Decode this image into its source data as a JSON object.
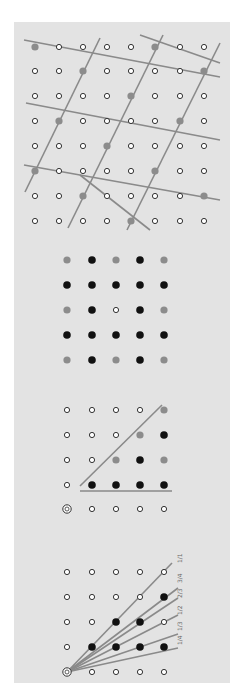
{
  "colors": {
    "background": "#ffffff",
    "panel": "#e3e3e3",
    "line": "#8a8a8a",
    "gray_dot": "#8c8c8c",
    "black_dot": "#111111",
    "white_dot_fill": "#ffffff",
    "white_dot_stroke": "#333333"
  },
  "panels": [
    {
      "id": "sublattice",
      "xs": [
        35,
        59,
        83,
        107,
        131,
        155,
        180,
        204
      ],
      "ys": [
        47,
        71,
        96,
        121,
        146,
        171,
        196,
        221
      ],
      "grid": [
        "GwwwwGww",
        "wwGwwwwG",
        "wwwwGwww",
        "wGwwwwGw",
        "wwwGwwww",
        "GwwwwGww",
        "wwGwwwwG",
        "wwwwGwww"
      ],
      "lines": [
        [
          24,
          40,
          220,
          77
        ],
        [
          140,
          35,
          220,
          63
        ],
        [
          26,
          103,
          220,
          140
        ],
        [
          24,
          165,
          220,
          200
        ],
        [
          80,
          175,
          150,
          230
        ],
        [
          100,
          38,
          25,
          192
        ],
        [
          163,
          35,
          68,
          228
        ],
        [
          220,
          43,
          127,
          230
        ]
      ]
    },
    {
      "id": "neighbors",
      "xs": [
        67,
        92,
        116,
        140,
        164
      ],
      "ys": [
        260,
        285,
        310,
        335,
        360
      ],
      "grid": [
        "GBGBG",
        "BBBBB",
        "GBwBG",
        "BBBBB",
        "GBGBG"
      ],
      "lines": []
    },
    {
      "id": "triangle",
      "xs": [
        67,
        92,
        116,
        140,
        164
      ],
      "ys": [
        410,
        435,
        460,
        485,
        509
      ],
      "grid": [
        "wwwwG",
        "wwwGB",
        "wwGBG",
        "wBBBB",
        "Owwww"
      ],
      "lines": [
        [
          80,
          486,
          162,
          405
        ],
        [
          80,
          491,
          172,
          491
        ]
      ]
    },
    {
      "id": "slopes",
      "xs": [
        67,
        92,
        116,
        140,
        164
      ],
      "ys": [
        572,
        597,
        622,
        647,
        672
      ],
      "grid": [
        "wwwww",
        "wwwwB",
        "wwBBw",
        "wBBBB",
        "Owwww"
      ],
      "lines": [
        [
          67,
          672,
          172,
          563
        ],
        [
          67,
          672,
          178,
          588
        ],
        [
          67,
          672,
          178,
          598
        ],
        [
          67,
          672,
          178,
          615
        ],
        [
          67,
          672,
          178,
          634
        ],
        [
          67,
          672,
          178,
          648
        ]
      ],
      "labels": [
        {
          "text": "1/1",
          "x": 182,
          "y": 563
        },
        {
          "text": "3/4",
          "x": 182,
          "y": 583
        },
        {
          "text": "2/3",
          "x": 182,
          "y": 598
        },
        {
          "text": "1/2",
          "x": 182,
          "y": 615
        },
        {
          "text": "1/3",
          "x": 182,
          "y": 631
        },
        {
          "text": "1/4",
          "x": 182,
          "y": 645
        }
      ]
    }
  ]
}
